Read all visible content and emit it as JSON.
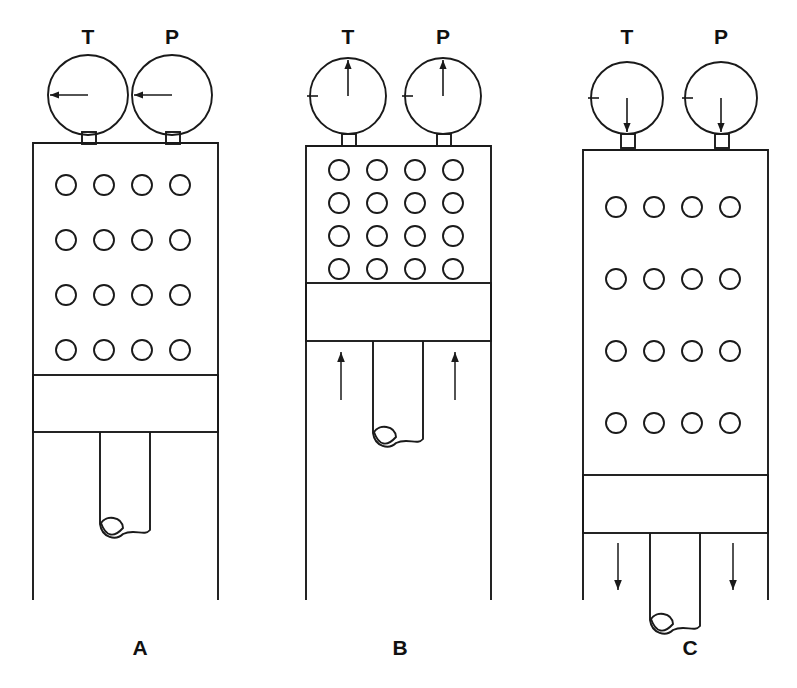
{
  "figure": {
    "background_color": "#ffffff",
    "line_color": "#1a1a1a",
    "width": 797,
    "height": 688
  },
  "panels": [
    {
      "id": "A",
      "label": "A",
      "label_x": 140,
      "label_y": 655,
      "state": "initial",
      "gauges": [
        {
          "name": "temperature-gauge",
          "label": "T",
          "label_x": 88,
          "label_y": 44,
          "cx": 88,
          "cy": 95,
          "r": 40,
          "needle_angle_deg": 180,
          "needle_direction": "left",
          "has_arrowhead": true,
          "has_tick": false,
          "stem_x": 82,
          "stem_y": 132,
          "stem_w": 14,
          "stem_h": 12
        },
        {
          "name": "pressure-gauge",
          "label": "P",
          "label_x": 172,
          "label_y": 44,
          "cx": 172,
          "cy": 95,
          "r": 40,
          "needle_angle_deg": 180,
          "needle_direction": "left",
          "has_arrowhead": true,
          "has_tick": false,
          "stem_x": 166,
          "stem_y": 132,
          "stem_w": 14,
          "stem_h": 12
        }
      ],
      "cylinder": {
        "x": 33,
        "y": 143,
        "w": 185,
        "h": 457,
        "open_bottom": true
      },
      "chamber": {
        "x": 33,
        "y": 143,
        "w": 185,
        "h": 232
      },
      "piston": {
        "x": 33,
        "y": 375,
        "w": 185,
        "h": 57
      },
      "rod": {
        "x": 100,
        "y": 432,
        "w": 50,
        "h": 100
      },
      "molecules": {
        "rows": 4,
        "cols": 4,
        "radius": 10,
        "x_start": 66,
        "x_step": 38,
        "y_start": 185,
        "y_step": 55,
        "count": 16
      },
      "force_arrows": []
    },
    {
      "id": "B",
      "label": "B",
      "label_x": 400,
      "label_y": 655,
      "state": "compressed",
      "gauges": [
        {
          "name": "temperature-gauge",
          "label": "T",
          "label_x": 348,
          "label_y": 44,
          "cx": 348,
          "cy": 96,
          "r": 38,
          "needle_angle_deg": 270,
          "needle_direction": "up",
          "has_arrowhead": true,
          "has_tick": true,
          "tick_angle_deg": 180,
          "stem_x": 342,
          "stem_y": 134,
          "stem_w": 14,
          "stem_h": 12
        },
        {
          "name": "pressure-gauge",
          "label": "P",
          "label_x": 443,
          "label_y": 44,
          "cx": 443,
          "cy": 96,
          "r": 38,
          "needle_angle_deg": 270,
          "needle_direction": "up",
          "has_arrowhead": true,
          "has_tick": true,
          "tick_angle_deg": 180,
          "stem_x": 437,
          "stem_y": 134,
          "stem_w": 14,
          "stem_h": 12
        }
      ],
      "cylinder": {
        "x": 306,
        "y": 146,
        "w": 185,
        "h": 454,
        "open_bottom": true
      },
      "chamber": {
        "x": 306,
        "y": 146,
        "w": 185,
        "h": 137
      },
      "piston": {
        "x": 306,
        "y": 283,
        "w": 185,
        "h": 58
      },
      "rod": {
        "x": 373,
        "y": 341,
        "w": 50,
        "h": 100
      },
      "molecules": {
        "rows": 4,
        "cols": 4,
        "radius": 10,
        "x_start": 339,
        "x_step": 38,
        "y_start": 170,
        "y_step": 33,
        "count": 16
      },
      "force_arrows": [
        {
          "direction": "up",
          "x": 341,
          "y_tail": 400,
          "y_head": 352
        },
        {
          "direction": "up",
          "x": 455,
          "y_tail": 400,
          "y_head": 352
        }
      ]
    },
    {
      "id": "C",
      "label": "C",
      "label_x": 690,
      "label_y": 655,
      "state": "expanded",
      "gauges": [
        {
          "name": "temperature-gauge",
          "label": "T",
          "label_x": 627,
          "label_y": 44,
          "cx": 627,
          "cy": 98,
          "r": 36,
          "needle_angle_deg": 90,
          "needle_direction": "down",
          "has_arrowhead": true,
          "has_tick": true,
          "tick_angle_deg": 180,
          "stem_x": 621,
          "stem_y": 134,
          "stem_w": 14,
          "stem_h": 14
        },
        {
          "name": "pressure-gauge",
          "label": "P",
          "label_x": 721,
          "label_y": 44,
          "cx": 721,
          "cy": 98,
          "r": 36,
          "needle_angle_deg": 90,
          "needle_direction": "down",
          "has_arrowhead": true,
          "has_tick": true,
          "tick_angle_deg": 180,
          "stem_x": 715,
          "stem_y": 134,
          "stem_w": 14,
          "stem_h": 14
        }
      ],
      "cylinder": {
        "x": 583,
        "y": 150,
        "w": 185,
        "h": 450,
        "open_bottom": true
      },
      "chamber": {
        "x": 583,
        "y": 150,
        "w": 185,
        "h": 325
      },
      "piston": {
        "x": 583,
        "y": 475,
        "w": 185,
        "h": 58
      },
      "rod": {
        "x": 650,
        "y": 533,
        "w": 50,
        "h": 95
      },
      "molecules": {
        "rows": 4,
        "cols": 4,
        "radius": 10,
        "x_start": 616,
        "x_step": 38,
        "y_start": 207,
        "y_step": 72,
        "count": 16
      },
      "force_arrows": [
        {
          "direction": "down",
          "x": 618,
          "y_tail": 543,
          "y_head": 590
        },
        {
          "direction": "down",
          "x": 733,
          "y_tail": 543,
          "y_head": 590
        }
      ]
    }
  ]
}
